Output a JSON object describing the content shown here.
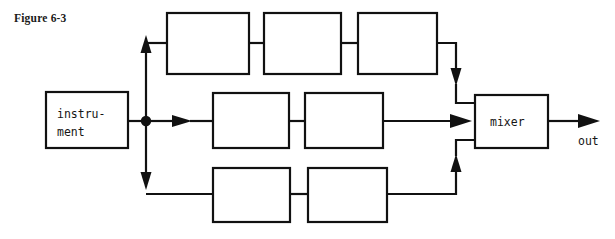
{
  "figure": {
    "label": "Figure 6-3"
  },
  "diagram": {
    "type": "signal-flow-block-diagram",
    "source_block": {
      "name": "instrument",
      "line1": "instru-",
      "line2": "ment"
    },
    "sink_block": {
      "name": "mixer",
      "label": "mixer"
    },
    "output": {
      "label": "out"
    },
    "chains": {
      "top": {
        "box_count": 3,
        "labels": [
          "",
          "",
          ""
        ]
      },
      "middle": {
        "box_count": 2,
        "labels": [
          "",
          ""
        ]
      },
      "bottom": {
        "box_count": 2,
        "labels": [
          "",
          ""
        ]
      }
    },
    "junction": {
      "name": "split-node"
    },
    "colors": {
      "stroke": "#111111",
      "background": "#ffffff",
      "text": "#151515"
    }
  }
}
